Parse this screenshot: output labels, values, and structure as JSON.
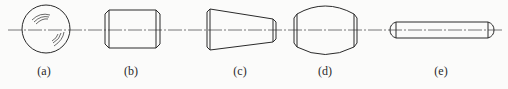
{
  "figure": {
    "colors": {
      "background": "#fbfbfa",
      "stroke": "#2a2a2a",
      "axis": "#555555"
    },
    "panels": [
      {
        "id": "a",
        "label": "(a)",
        "shape": "sphere",
        "label_x": 44
      },
      {
        "id": "b",
        "label": "(b)",
        "shape": "cylinder",
        "label_x": 131
      },
      {
        "id": "c",
        "label": "(c)",
        "shape": "truncated-cone",
        "label_x": 240
      },
      {
        "id": "d",
        "label": "(d)",
        "shape": "barrel",
        "label_x": 325
      },
      {
        "id": "e",
        "label": "(e)",
        "shape": "long-rod",
        "label_x": 441
      }
    ]
  }
}
